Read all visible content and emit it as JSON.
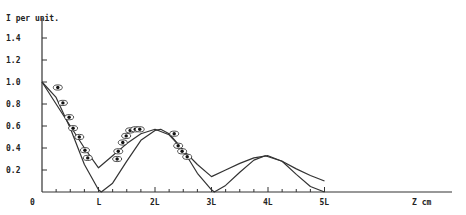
{
  "chart_data": {
    "type": "line",
    "title": "",
    "ylabel": "I per unit.",
    "xlabel": "Z cm",
    "x_tick_labels": [
      "0",
      "L",
      "2L",
      "3L",
      "4L",
      "5L"
    ],
    "x_tick_values": [
      0,
      1,
      2,
      3,
      4,
      5
    ],
    "y_tick_labels": [
      "0.2",
      "0.4",
      "0.6",
      "0.8",
      "1.0",
      "1.2",
      "1.4"
    ],
    "y_tick_values": [
      0.2,
      0.4,
      0.6,
      0.8,
      1.0,
      1.2,
      1.4
    ],
    "xlim": [
      0,
      7.2
    ],
    "ylim": [
      0,
      1.5
    ],
    "grid": false,
    "legend": null,
    "series": [
      {
        "name": "upper-envelope-curve",
        "style": "line",
        "x": [
          0,
          0.25,
          0.5,
          0.75,
          1.0,
          1.25,
          1.5,
          1.75,
          2.0,
          2.25,
          2.5,
          2.75,
          3.0,
          3.25,
          3.5,
          3.75,
          4.0,
          4.25,
          4.5,
          4.75,
          5.0
        ],
        "y": [
          1.0,
          0.8,
          0.6,
          0.4,
          0.22,
          0.33,
          0.44,
          0.53,
          0.57,
          0.52,
          0.38,
          0.25,
          0.14,
          0.2,
          0.26,
          0.31,
          0.33,
          0.28,
          0.21,
          0.15,
          0.1
        ]
      },
      {
        "name": "lower-theory-curve",
        "style": "line",
        "x": [
          0,
          0.25,
          0.5,
          0.75,
          1.0,
          1.05,
          1.25,
          1.5,
          1.75,
          2.0,
          2.1,
          2.25,
          2.5,
          2.75,
          3.0,
          3.05,
          3.25,
          3.5,
          3.75,
          3.95,
          4.25,
          4.5,
          4.75,
          5.0
        ],
        "y": [
          1.0,
          0.86,
          0.58,
          0.25,
          0.02,
          0.0,
          0.08,
          0.28,
          0.47,
          0.56,
          0.57,
          0.53,
          0.38,
          0.17,
          0.02,
          0.0,
          0.06,
          0.18,
          0.29,
          0.33,
          0.28,
          0.16,
          0.05,
          0.0
        ]
      },
      {
        "name": "measured-points",
        "style": "scatter",
        "marker": "eye-ellipse",
        "x": [
          0.28,
          0.37,
          0.48,
          0.55,
          0.66,
          0.76,
          0.81,
          1.33,
          1.35,
          1.43,
          1.49,
          1.56,
          1.65,
          1.73,
          2.34,
          2.41,
          2.48,
          2.57
        ],
        "y": [
          0.95,
          0.81,
          0.68,
          0.58,
          0.5,
          0.38,
          0.31,
          0.3,
          0.37,
          0.45,
          0.51,
          0.56,
          0.57,
          0.57,
          0.53,
          0.42,
          0.37,
          0.32
        ]
      }
    ]
  },
  "axes": {
    "y_label": "I per unit.",
    "x_label": "Z cm",
    "origin_label": "0"
  }
}
